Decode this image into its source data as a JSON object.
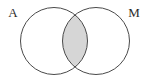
{
  "figure": {
    "type": "venn-diagram",
    "title": "",
    "background_color": "#ffffff",
    "width": 150,
    "height": 81
  },
  "sets": [
    {
      "id": "A",
      "label": "A",
      "label_x": 13,
      "label_y": 17,
      "circle": {
        "cx": 54,
        "cy": 41,
        "r": 33.5
      },
      "stroke_color": "#4a4a4a",
      "fill_color": "#ffffff",
      "shaded": false
    },
    {
      "id": "M",
      "label": "M",
      "label_x": 134,
      "label_y": 17,
      "circle": {
        "cx": 96,
        "cy": 41,
        "r": 33.5
      },
      "stroke_color": "#4a4a4a",
      "fill_color": "#ffffff",
      "shaded": false
    }
  ],
  "regions": [
    {
      "id": "intersection",
      "name": "A-intersect-M",
      "shaded": true,
      "fill_color": "#d6d6d6",
      "label": ""
    },
    {
      "id": "a-only",
      "name": "A-only",
      "shaded": false,
      "fill_color": "#ffffff",
      "label": ""
    },
    {
      "id": "m-only",
      "name": "M-only",
      "shaded": false,
      "fill_color": "#ffffff",
      "label": ""
    }
  ],
  "style": {
    "stroke_color": "#4a4a4a",
    "stroke_width": 1,
    "shade_color": "#d6d6d6",
    "label_color": "#2b2b2b",
    "label_font_size": 13
  }
}
